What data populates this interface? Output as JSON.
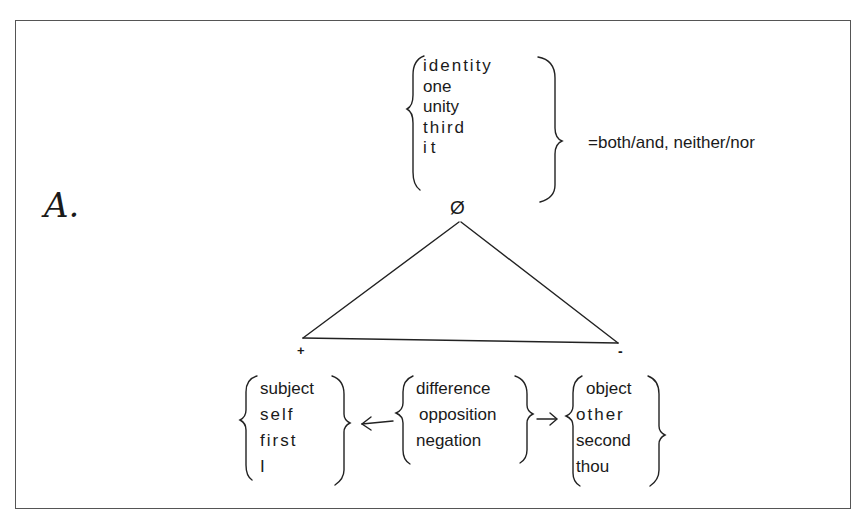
{
  "figure_label": "A.",
  "top_group": {
    "terms": [
      "identity",
      "one",
      "unity",
      "third",
      "it"
    ],
    "apex_symbol": "Ø",
    "annotation": "=both/and,  neither/nor"
  },
  "vertices": {
    "left_sign": "+",
    "right_sign": "-"
  },
  "left_group": {
    "terms": [
      "subject",
      "self",
      "first",
      "I"
    ]
  },
  "middle_group": {
    "terms": [
      "difference",
      "opposition",
      "negation"
    ],
    "arrow_left": "←",
    "arrow_right": "→"
  },
  "right_group": {
    "terms": [
      "object",
      "other",
      "second",
      "thou"
    ]
  }
}
